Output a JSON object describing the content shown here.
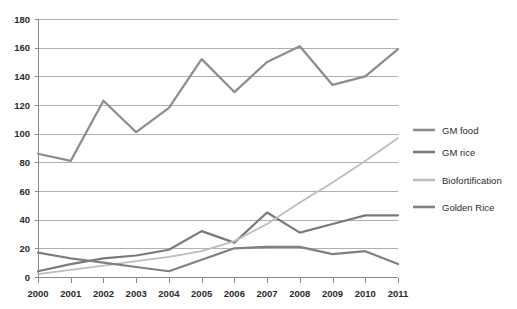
{
  "chart_data": {
    "type": "line",
    "title": "",
    "subtitle": "",
    "xlabel": "",
    "ylabel": "",
    "x": [
      2000,
      2001,
      2002,
      2003,
      2004,
      2005,
      2006,
      2007,
      2008,
      2009,
      2010,
      2011
    ],
    "categories": [
      "2000",
      "2001",
      "2002",
      "2003",
      "2004",
      "2005",
      "2006",
      "2007",
      "2008",
      "2009",
      "2010",
      "2011"
    ],
    "xlim": [
      2000,
      2011
    ],
    "ylim": [
      0,
      180
    ],
    "ytick_values": [
      0,
      20,
      40,
      60,
      80,
      100,
      120,
      140,
      160,
      180
    ],
    "ytick_labels": [
      "0",
      "20",
      "40",
      "60",
      "80",
      "100",
      "120",
      "140",
      "160",
      "180"
    ],
    "grid": "horizontal",
    "legend_position": "right",
    "series": [
      {
        "name": "GM food",
        "color": "#8c8c8c",
        "width": 2.2,
        "values": [
          86,
          81,
          123,
          101,
          118,
          152,
          129,
          150,
          161,
          134,
          140,
          159
        ]
      },
      {
        "name": "GM rice",
        "color": "#7a7a7a",
        "width": 2.2,
        "values": [
          4,
          9,
          13,
          15,
          19,
          32,
          24,
          45,
          31,
          37,
          43,
          43
        ]
      },
      {
        "name": "Biofortification",
        "color": "#bdbdbd",
        "width": 1.8,
        "values": [
          2,
          5,
          8,
          11,
          14,
          18,
          25,
          37,
          52,
          66,
          81,
          97
        ]
      },
      {
        "name": "Golden Rice",
        "color": "#808080",
        "width": 2.2,
        "values": [
          17,
          13,
          10,
          7,
          4,
          12,
          20,
          21,
          21,
          16,
          18,
          9
        ]
      }
    ]
  },
  "legend": {
    "items": [
      {
        "label": "GM food",
        "color": "#8c8c8c"
      },
      {
        "label": "GM rice",
        "color": "#7a7a7a"
      },
      {
        "label": "Biofortification",
        "color": "#bdbdbd"
      },
      {
        "label": "Golden Rice",
        "color": "#808080"
      }
    ]
  },
  "style": {
    "grid_color": "#b0b0b0",
    "axis_color": "#8a8a8a",
    "text_color": "#2b2b2b",
    "background": "#ffffff"
  },
  "geometry": {
    "plot_left": 38,
    "plot_right": 398,
    "plot_top": 19,
    "plot_bottom": 277,
    "legend_x": 413,
    "legend_marker_width": 22,
    "legend_rows_y": [
      130,
      152,
      180,
      207
    ]
  }
}
